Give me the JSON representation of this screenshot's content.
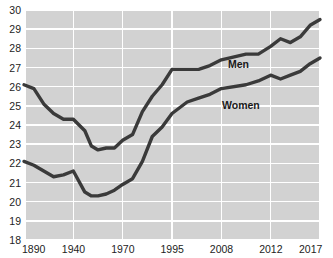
{
  "chart_data": {
    "type": "line",
    "title": "",
    "xlabel": "",
    "ylabel": "",
    "ylim": [
      18,
      30
    ],
    "ytick_labels": [
      "30",
      "29",
      "28",
      "27",
      "26",
      "25",
      "24",
      "23",
      "22",
      "21",
      "20",
      "19",
      "18"
    ],
    "ytick_values": [
      30,
      29,
      28,
      27,
      26,
      25,
      24,
      23,
      22,
      21,
      20,
      19,
      18
    ],
    "xtick_labels": [
      "1890",
      "1940",
      "1970",
      "1995",
      "2008",
      "2012",
      "2017"
    ],
    "xtick_values": [
      1890,
      1940,
      1970,
      1995,
      2008,
      2012,
      2017
    ],
    "grid": true,
    "legend_position": "inline-annotation",
    "series": [
      {
        "name": "Men",
        "label": "Men",
        "color": "#3a3a3a",
        "x": [
          1890,
          1900,
          1910,
          1920,
          1930,
          1940,
          1947,
          1951,
          1955,
          1960,
          1965,
          1970,
          1975,
          1980,
          1985,
          1990,
          1995,
          1999,
          2002,
          2005,
          2008,
          2010,
          2011,
          2012,
          2013,
          2014,
          2015,
          2016,
          2017
        ],
        "values": [
          26.1,
          25.9,
          25.1,
          24.6,
          24.3,
          24.3,
          23.7,
          22.9,
          22.7,
          22.8,
          22.8,
          23.2,
          23.5,
          24.7,
          25.5,
          26.1,
          26.9,
          26.9,
          26.9,
          27.1,
          27.4,
          27.7,
          27.7,
          28.1,
          28.5,
          28.3,
          28.6,
          29.2,
          29.5
        ],
        "start_value": 26.1,
        "end_value": 29.5,
        "min_value": 22.7,
        "max_value": 29.5
      },
      {
        "name": "Women",
        "label": "Women",
        "color": "#3a3a3a",
        "x": [
          1890,
          1900,
          1910,
          1920,
          1930,
          1940,
          1947,
          1951,
          1955,
          1960,
          1965,
          1970,
          1975,
          1980,
          1985,
          1990,
          1995,
          1999,
          2002,
          2005,
          2008,
          2010,
          2011,
          2012,
          2013,
          2014,
          2015,
          2016,
          2017
        ],
        "values": [
          22.1,
          21.9,
          21.6,
          21.3,
          21.4,
          21.6,
          20.5,
          20.3,
          20.3,
          20.4,
          20.6,
          20.9,
          21.2,
          22.1,
          23.4,
          23.9,
          24.6,
          25.2,
          25.4,
          25.6,
          25.9,
          26.1,
          26.3,
          26.6,
          26.4,
          26.6,
          26.8,
          27.2,
          27.5
        ],
        "start_value": 22.1,
        "end_value": 27.5,
        "min_value": 20.3,
        "max_value": 27.5
      }
    ]
  },
  "style": {
    "plot_background": "#d2d2d2",
    "gridline_color": "#ffffff",
    "line_color": "#3a3a3a",
    "text_color": "#1d1d1d",
    "page_background": "#ffffff"
  }
}
